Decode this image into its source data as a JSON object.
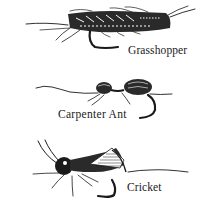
{
  "illustration": {
    "flies": [
      {
        "name": "Grasshopper",
        "icon": "grasshopper-fly-icon"
      },
      {
        "name": "Carpenter Ant",
        "icon": "carpenter-ant-fly-icon"
      },
      {
        "name": "Cricket",
        "icon": "cricket-fly-icon"
      }
    ],
    "colors": {
      "ink": "#1a1a1a",
      "background": "#ffffff"
    }
  }
}
